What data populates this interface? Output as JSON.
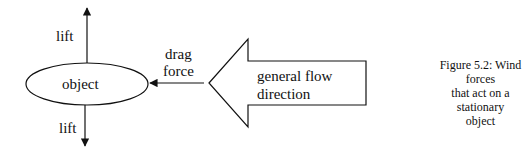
{
  "diagram": {
    "object_label": "object",
    "lift_top_label": "lift",
    "lift_bottom_label": "lift",
    "drag_label_line1": "drag",
    "drag_label_line2": "force",
    "flow_label_line1": "general flow",
    "flow_label_line2": "direction"
  },
  "caption": {
    "line1": "Figure 5.2: Wind forces",
    "line2": "that act on a stationary",
    "line3": "object"
  },
  "colors": {
    "stroke": "#111111",
    "background": "#ffffff"
  }
}
